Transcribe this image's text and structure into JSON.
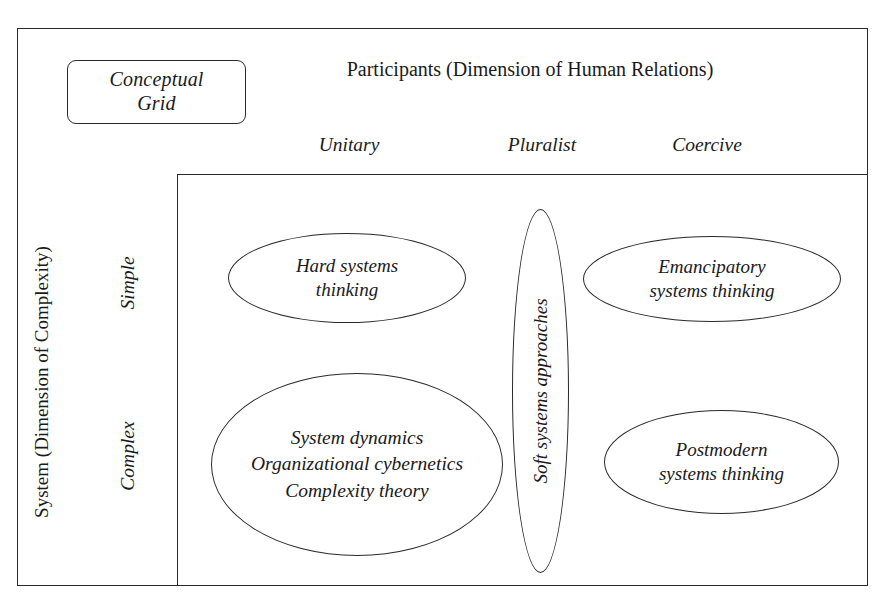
{
  "diagram": {
    "title_box": {
      "line1": "Conceptual",
      "line2": "Grid"
    },
    "column_axis_title": "Participants (Dimension of Human Relations)",
    "row_axis_title": "System (Dimension of Complexity)",
    "columns": [
      {
        "label": "Unitary"
      },
      {
        "label": "Pluralist"
      },
      {
        "label": "Coercive"
      }
    ],
    "rows": [
      {
        "label": "Simple"
      },
      {
        "label": "Complex"
      }
    ],
    "cells": [
      {
        "id": "simple-unitary",
        "shape": "ellipse",
        "orientation": "horizontal",
        "text": "Hard systems\nthinking"
      },
      {
        "id": "simple-coercive",
        "shape": "ellipse",
        "orientation": "horizontal",
        "text": "Emancipatory\nsystems thinking"
      },
      {
        "id": "complex-unitary",
        "shape": "ellipse",
        "orientation": "horizontal",
        "text": "System dynamics\nOrganizational cybernetics\nComplexity theory"
      },
      {
        "id": "pluralist-span",
        "shape": "ellipse",
        "orientation": "vertical",
        "text": "Soft systems approaches"
      },
      {
        "id": "complex-coercive",
        "shape": "ellipse",
        "orientation": "horizontal",
        "text": "Postmodern\nsystems thinking"
      }
    ]
  }
}
